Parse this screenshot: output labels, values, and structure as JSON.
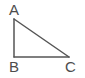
{
  "figure": {
    "name": "right-triangle",
    "background_color": "#ffffff",
    "stroke_color": "#555555",
    "stroke_width": 1.5,
    "label_color": "#4d4d4d",
    "width": 85,
    "height": 78,
    "vertices": [
      {
        "label": "A",
        "x": 14,
        "y": 19,
        "label_x": 9,
        "label_y": 2
      },
      {
        "label": "B",
        "x": 14,
        "y": 57,
        "label_x": 9,
        "label_y": 59
      },
      {
        "label": "C",
        "x": 69,
        "y": 57,
        "label_x": 65,
        "label_y": 59
      }
    ],
    "edges": [
      {
        "name": "side-AB",
        "from": "A",
        "to": "B"
      },
      {
        "name": "side-BC",
        "from": "B",
        "to": "C"
      },
      {
        "name": "side-AC",
        "from": "A",
        "to": "C"
      }
    ]
  }
}
